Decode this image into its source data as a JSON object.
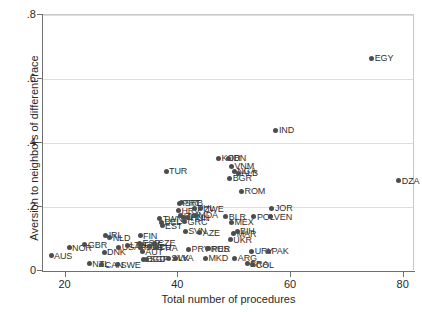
{
  "chart_data": {
    "type": "scatter",
    "title": "",
    "xlabel": "Total number of procedures",
    "ylabel": "Aversion to neighbors of different race",
    "xlim": [
      16,
      82
    ],
    "ylim": [
      0,
      0.8
    ],
    "xticks": [
      20,
      40,
      60,
      80
    ],
    "xtick_labels": [
      "20",
      "40",
      "60",
      "80"
    ],
    "yticks": [
      0,
      0.2,
      0.4,
      0.6,
      0.8
    ],
    "ytick_labels": [
      "0",
      ".2",
      ".4",
      ".6",
      ".8"
    ],
    "grid": "horizontal",
    "legend": "none",
    "marker_color": "#4d4d4d",
    "gridline_color": "#dedede",
    "axis_color": "#6f6f6f",
    "label_position": "right",
    "points": [
      {
        "label": "AUS",
        "x": 17.6,
        "y": 0.047
      },
      {
        "label": "NOR",
        "x": 20.8,
        "y": 0.072
      },
      {
        "label": "GBR",
        "x": 23.6,
        "y": 0.082
      },
      {
        "label": "NZL",
        "x": 24.4,
        "y": 0.022
      },
      {
        "label": "CAN",
        "x": 26.6,
        "y": 0.02
      },
      {
        "label": "DNK",
        "x": 27.0,
        "y": 0.058
      },
      {
        "label": "IRL",
        "x": 27.3,
        "y": 0.112
      },
      {
        "label": "NLD",
        "x": 28.0,
        "y": 0.104
      },
      {
        "label": "SWE",
        "x": 29.4,
        "y": 0.02
      },
      {
        "label": "USA",
        "x": 29.6,
        "y": 0.074
      },
      {
        "label": "LTU",
        "x": 31.1,
        "y": 0.08
      },
      {
        "label": "FIN",
        "x": 33.4,
        "y": 0.11
      },
      {
        "label": "ESP",
        "x": 33.3,
        "y": 0.086
      },
      {
        "label": "CHE",
        "x": 33.6,
        "y": 0.082
      },
      {
        "label": "ISL",
        "x": 33.5,
        "y": 0.074
      },
      {
        "label": "AUT",
        "x": 33.8,
        "y": 0.06
      },
      {
        "label": "BGD",
        "x": 34.0,
        "y": 0.036
      },
      {
        "label": "SGP",
        "x": 34.6,
        "y": 0.036
      },
      {
        "label": "DEU",
        "x": 35.1,
        "y": 0.076
      },
      {
        "label": "CZE",
        "x": 36.0,
        "y": 0.086
      },
      {
        "label": "FRA",
        "x": 36.4,
        "y": 0.072
      },
      {
        "label": "TWN",
        "x": 36.9,
        "y": 0.164
      },
      {
        "label": "EST",
        "x": 37.3,
        "y": 0.142
      },
      {
        "label": "BEL",
        "x": 37.2,
        "y": 0.152
      },
      {
        "label": "TUR",
        "x": 38.0,
        "y": 0.312
      },
      {
        "label": "SVK",
        "x": 38.4,
        "y": 0.04
      },
      {
        "label": "LVA",
        "x": 39.6,
        "y": 0.04
      },
      {
        "label": "HRV",
        "x": 40.2,
        "y": 0.188
      },
      {
        "label": "ITA",
        "x": 40.6,
        "y": 0.172
      },
      {
        "label": "PRT",
        "x": 40.4,
        "y": 0.212
      },
      {
        "label": "SRB",
        "x": 40.8,
        "y": 0.214
      },
      {
        "label": "JPN",
        "x": 41.1,
        "y": 0.168
      },
      {
        "label": "GRC",
        "x": 41.3,
        "y": 0.154
      },
      {
        "label": "SVN",
        "x": 41.4,
        "y": 0.124
      },
      {
        "label": "HUN",
        "x": 41.8,
        "y": 0.166
      },
      {
        "label": "PRY",
        "x": 42.0,
        "y": 0.068
      },
      {
        "label": "PHL",
        "x": 43.0,
        "y": 0.196
      },
      {
        "label": "MDA",
        "x": 43.2,
        "y": 0.174
      },
      {
        "label": "ZWE",
        "x": 44.2,
        "y": 0.194
      },
      {
        "label": "AZE",
        "x": 44.0,
        "y": 0.12
      },
      {
        "label": "RUS",
        "x": 45.4,
        "y": 0.07
      },
      {
        "label": "MKD",
        "x": 45.0,
        "y": 0.04
      },
      {
        "label": "PER",
        "x": 45.6,
        "y": 0.07
      },
      {
        "label": "KOR",
        "x": 47.3,
        "y": 0.352
      },
      {
        "label": "IDN",
        "x": 49.0,
        "y": 0.352
      },
      {
        "label": "VNM",
        "x": 49.6,
        "y": 0.328
      },
      {
        "label": "NGA",
        "x": 50.1,
        "y": 0.312
      },
      {
        "label": "ALB",
        "x": 50.8,
        "y": 0.306
      },
      {
        "label": "BGR",
        "x": 49.3,
        "y": 0.29
      },
      {
        "label": "MEX",
        "x": 49.6,
        "y": 0.152
      },
      {
        "label": "BLR",
        "x": 48.6,
        "y": 0.17
      },
      {
        "label": "MAR",
        "x": 50.0,
        "y": 0.116
      },
      {
        "label": "BIH",
        "x": 50.6,
        "y": 0.124
      },
      {
        "label": "UKR",
        "x": 49.4,
        "y": 0.098
      },
      {
        "label": "ROM",
        "x": 51.4,
        "y": 0.25
      },
      {
        "label": "ARG",
        "x": 50.2,
        "y": 0.04
      },
      {
        "label": "BRA",
        "x": 52.4,
        "y": 0.022
      },
      {
        "label": "COL",
        "x": 53.4,
        "y": 0.02
      },
      {
        "label": "URY",
        "x": 53.2,
        "y": 0.062
      },
      {
        "label": "PAK",
        "x": 56.2,
        "y": 0.062
      },
      {
        "label": "POL",
        "x": 53.6,
        "y": 0.17
      },
      {
        "label": "JOR",
        "x": 56.8,
        "y": 0.196
      },
      {
        "label": "VEN",
        "x": 56.6,
        "y": 0.17
      },
      {
        "label": "IND",
        "x": 57.5,
        "y": 0.44
      },
      {
        "label": "EGY",
        "x": 74.5,
        "y": 0.665
      },
      {
        "label": "DZA",
        "x": 79.3,
        "y": 0.282
      }
    ]
  }
}
